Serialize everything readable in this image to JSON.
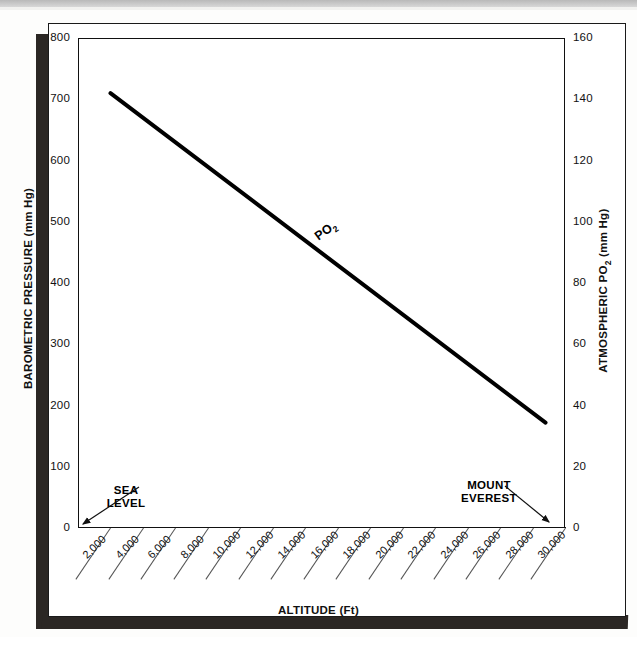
{
  "chart_data": {
    "type": "line",
    "title": "",
    "xlabel": "ALTITUDE (Ft)",
    "ylabel": "BAROMETRIC PRESSURE (mm Hg)",
    "y2label": "ATMOSPHERIC PO2 (mm Hg)",
    "xlim": [
      0,
      30000
    ],
    "ylim": [
      0,
      800
    ],
    "y2lim": [
      0,
      160
    ],
    "grid": false,
    "legend": "none",
    "x_tick_labels": [
      "2,000",
      "4,000",
      "6,000",
      "8,000",
      "10,000",
      "12,000",
      "14,000",
      "16,000",
      "18,000",
      "20,000",
      "22,000",
      "24,000",
      "26,000",
      "28,000",
      "30,000"
    ],
    "x_tick_values": [
      2000,
      4000,
      6000,
      8000,
      10000,
      12000,
      14000,
      16000,
      18000,
      20000,
      22000,
      24000,
      26000,
      28000,
      30000
    ],
    "y_tick_labels": [
      "0",
      "100",
      "200",
      "300",
      "400",
      "500",
      "600",
      "700",
      "800"
    ],
    "y_tick_values": [
      0,
      100,
      200,
      300,
      400,
      500,
      600,
      700,
      800
    ],
    "y2_tick_labels": [
      "0",
      "20",
      "40",
      "60",
      "80",
      "100",
      "120",
      "140",
      "160"
    ],
    "y2_tick_values": [
      0,
      20,
      40,
      60,
      80,
      100,
      120,
      140,
      160
    ],
    "series": [
      {
        "name": "PO2",
        "label": "PO",
        "label_sub": "2",
        "x": [
          2000,
          28800
        ],
        "y": [
          710,
          172
        ],
        "y2": [
          142,
          34.4
        ],
        "color": "#000000",
        "linewidth": 4
      }
    ],
    "annotations": [
      {
        "name": "sea-level",
        "line1": "SEA",
        "line2": "LEVEL",
        "points_to_x": 0
      },
      {
        "name": "mount-everest",
        "line1": "MOUNT",
        "line2": "EVEREST",
        "points_to_x": 29000
      }
    ]
  },
  "axes": {
    "left": {
      "title": "BAROMETRIC PRESSURE (mm Hg)",
      "ticks": [
        "800",
        "700",
        "600",
        "500",
        "400",
        "300",
        "200",
        "100",
        "0"
      ]
    },
    "right": {
      "title_pre": "ATMOSPHERIC PO",
      "title_sub": "2",
      "title_post": " (mm Hg)",
      "ticks": [
        "160",
        "140",
        "120",
        "100",
        "80",
        "60",
        "40",
        "20",
        "0"
      ]
    },
    "bottom": {
      "title": "ALTITUDE (Ft)",
      "ticks": [
        "2,000",
        "4,000",
        "6,000",
        "8,000",
        "10,000",
        "12,000",
        "14,000",
        "16,000",
        "18,000",
        "20,000",
        "22,000",
        "24,000",
        "26,000",
        "28,000",
        "30,000"
      ]
    }
  },
  "annotations": {
    "sea_level": {
      "line1": "SEA",
      "line2": "LEVEL"
    },
    "mount_everest": {
      "line1": "MOUNT",
      "line2": "EVEREST"
    }
  },
  "series_label": {
    "text": "PO",
    "subscript": "2"
  }
}
